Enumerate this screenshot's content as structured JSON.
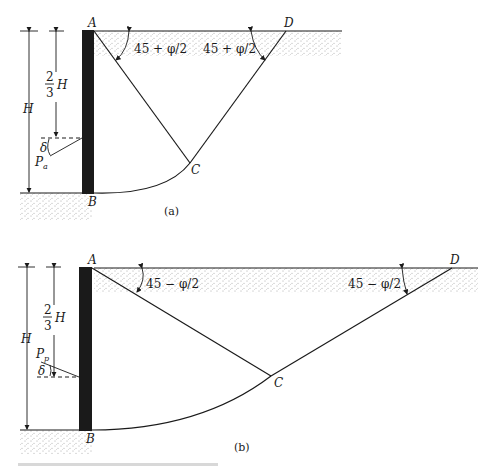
{
  "figure_a": {
    "label": "(a)",
    "points": {
      "A": "A",
      "B": "B",
      "C": "C",
      "D": "D"
    },
    "angle_left": "45 + φ/2",
    "angle_right": "45 + φ/2",
    "dim_H": "H",
    "dim_two_thirds_num": "2",
    "dim_two_thirds_den": "3",
    "dim_two_thirds_var": "H",
    "delta": "δ",
    "force": "P",
    "force_sub": "a"
  },
  "figure_b": {
    "label": "(b)",
    "points": {
      "A": "A",
      "B": "B",
      "C": "C",
      "D": "D"
    },
    "angle_left": "45 − φ/2",
    "angle_right": "45 − φ/2",
    "dim_H": "H",
    "dim_two_thirds_num": "2",
    "dim_two_thirds_den": "3",
    "dim_two_thirds_var": "H",
    "delta": "δ",
    "force": "P",
    "force_sub": "p"
  },
  "colors": {
    "ink": "#1a1a1a",
    "paper": "#ffffff"
  }
}
